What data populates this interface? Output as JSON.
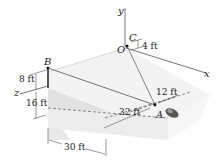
{
  "figure": {
    "points": {
      "B": "B",
      "C": "C",
      "O": "O",
      "A": "A"
    },
    "axes": {
      "x": "x",
      "y": "y",
      "z": "z"
    },
    "dimensions": {
      "d_8ft": "8 ft",
      "d_16ft": "16 ft",
      "d_30ft": "30 ft",
      "d_32ft": "32 ft",
      "d_12ft": "12 ft",
      "d_4ft": "4 ft"
    },
    "colors": {
      "surface_light": "#f2f2f2",
      "surface_mid": "#e4e4e4",
      "line": "#555555",
      "cable": "#6a6a6a"
    }
  }
}
